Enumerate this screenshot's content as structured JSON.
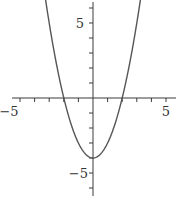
{
  "chart_data": {
    "type": "line",
    "title": "",
    "xlabel": "",
    "ylabel": "",
    "function": "y = x^2 - 4",
    "series": [
      {
        "name": "y = x^2 - 4",
        "x": [
          -3.25,
          -3,
          -2.5,
          -2,
          -1.5,
          -1,
          -0.5,
          0,
          0.5,
          1,
          1.5,
          2,
          2.5,
          3,
          3.25
        ],
        "values": [
          6.56,
          5,
          2.25,
          0,
          -1.75,
          -3,
          -3.75,
          -4,
          -3.75,
          -3,
          -1.75,
          0,
          2.25,
          5,
          6.56
        ]
      }
    ],
    "xlim": [
      -6,
      5.6
    ],
    "ylim": [
      -6.5,
      6.5
    ],
    "x_ticks": [
      -5,
      -4,
      -3,
      -2,
      -1,
      1,
      2,
      3,
      4,
      5
    ],
    "y_ticks": [
      -6,
      -5,
      -4,
      -3,
      -2,
      -1,
      1,
      2,
      3,
      4,
      5,
      6
    ],
    "x_tick_labels": [
      {
        "value": -5,
        "label": "−5"
      },
      {
        "value": 5,
        "label": "5"
      }
    ],
    "y_tick_labels": [
      {
        "value": 5,
        "label": "5"
      },
      {
        "value": -5,
        "label": "−5"
      }
    ],
    "grid": false,
    "legend": "none",
    "colors": {
      "axis": "#3a3a3a",
      "curve": "#555555"
    }
  },
  "labels": {
    "x_neg5": "−5",
    "x_pos5": "5",
    "y_pos5": "5",
    "y_neg5": "−5"
  }
}
